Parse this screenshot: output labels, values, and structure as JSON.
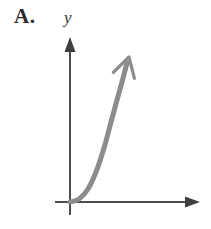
{
  "figure": {
    "panel_label": "A.",
    "background_color": "#ffffff"
  },
  "axes": {
    "y_label": "y",
    "x_label": "",
    "axis_color": "#4d4d4d",
    "axis_width_px": 2,
    "origin": {
      "x": 70,
      "y": 202
    },
    "y_axis": {
      "top_y": 38,
      "bottom_y": 215,
      "x": 70,
      "arrow": "up"
    },
    "x_axis": {
      "left_x": 55,
      "right_x": 199,
      "y": 202,
      "arrow": "right"
    }
  },
  "chart_data": {
    "type": "line",
    "title": "A.",
    "subtitle": "",
    "xlabel": "",
    "ylabel": "y",
    "grid": false,
    "legend": null,
    "curve_color": "#8c8c8c",
    "curve_width_px": 5,
    "arrowhead": "open-v",
    "x": [
      0,
      0.15,
      0.3,
      0.45,
      0.6,
      0.72,
      0.82,
      0.9,
      1.0
    ],
    "y": [
      0,
      0.02,
      0.08,
      0.2,
      0.38,
      0.56,
      0.72,
      0.85,
      1.0
    ],
    "xlim": [
      0,
      1.05
    ],
    "ylim": [
      0,
      1.05
    ],
    "points_px": [
      {
        "x": 70,
        "y": 202
      },
      {
        "x": 79,
        "y": 199
      },
      {
        "x": 88,
        "y": 189
      },
      {
        "x": 96,
        "y": 172
      },
      {
        "x": 104,
        "y": 148
      },
      {
        "x": 111,
        "y": 122
      },
      {
        "x": 117,
        "y": 100
      },
      {
        "x": 122,
        "y": 82
      },
      {
        "x": 127,
        "y": 63
      }
    ],
    "arrow_tip_px": {
      "x": 129,
      "y": 57
    }
  }
}
